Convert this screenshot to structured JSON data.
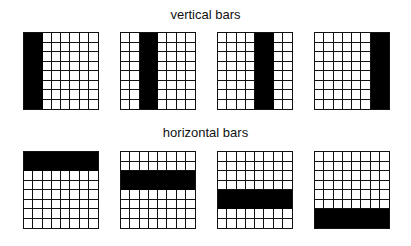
{
  "titles": {
    "top": "vertical bars",
    "bottom": "horizontal bars"
  },
  "grid": {
    "rows": 8,
    "cols": 8,
    "fill_color": "#000000",
    "line_color": "#111111"
  },
  "panels": [
    {
      "id": "v1",
      "orientation": "vertical",
      "bar_start": 0,
      "bar_span": 2,
      "x": 23,
      "y": 32
    },
    {
      "id": "v2",
      "orientation": "vertical",
      "bar_start": 2,
      "bar_span": 2,
      "x": 120,
      "y": 32
    },
    {
      "id": "v3",
      "orientation": "vertical",
      "bar_start": 4,
      "bar_span": 2,
      "x": 217,
      "y": 32
    },
    {
      "id": "v4",
      "orientation": "vertical",
      "bar_start": 6,
      "bar_span": 2,
      "x": 314,
      "y": 32
    },
    {
      "id": "h1",
      "orientation": "horizontal",
      "bar_start": 0,
      "bar_span": 2,
      "x": 23,
      "y": 151
    },
    {
      "id": "h2",
      "orientation": "horizontal",
      "bar_start": 2,
      "bar_span": 2,
      "x": 120,
      "y": 151
    },
    {
      "id": "h3",
      "orientation": "horizontal",
      "bar_start": 4,
      "bar_span": 2,
      "x": 217,
      "y": 151
    },
    {
      "id": "h4",
      "orientation": "horizontal",
      "bar_start": 6,
      "bar_span": 2,
      "x": 314,
      "y": 151
    }
  ]
}
